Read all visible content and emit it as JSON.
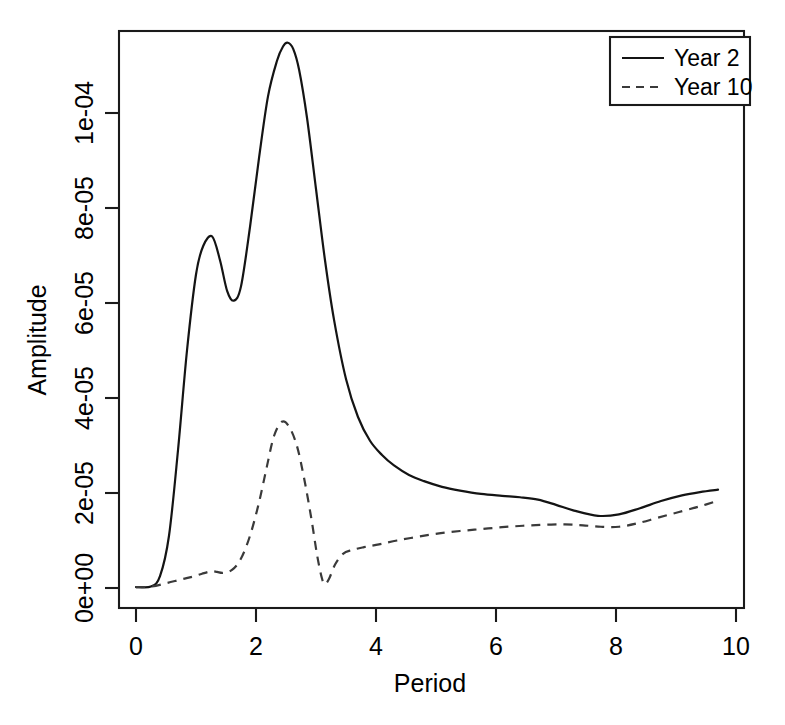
{
  "chart_data": {
    "type": "line",
    "title": "",
    "xlabel": "Period",
    "ylabel": "Amplitude",
    "xlim": [
      0,
      10
    ],
    "ylim": [
      0,
      0.000118
    ],
    "xticks": [
      0,
      2,
      4,
      6,
      8,
      10
    ],
    "xtick_labels": [
      "0",
      "2",
      "4",
      "6",
      "8",
      "10"
    ],
    "yticks": [
      0,
      2e-05,
      4e-05,
      6e-05,
      8e-05,
      0.0001
    ],
    "ytick_labels": [
      "0e+00",
      "2e-05",
      "4e-05",
      "6e-05",
      "8e-05",
      "1e-04"
    ],
    "grid": false,
    "legend_position": "top-right",
    "series": [
      {
        "name": "Year 2",
        "style": "solid",
        "color": "#141414",
        "x": [
          0.0,
          0.25,
          0.4,
          0.55,
          0.7,
          0.85,
          1.0,
          1.12,
          1.27,
          1.4,
          1.52,
          1.63,
          1.75,
          1.9,
          2.05,
          2.2,
          2.35,
          2.45,
          2.53,
          2.62,
          2.72,
          2.85,
          3.0,
          3.15,
          3.3,
          3.5,
          3.7,
          3.9,
          4.1,
          4.3,
          4.55,
          4.8,
          5.1,
          5.4,
          5.75,
          6.1,
          6.4,
          6.7,
          7.0,
          7.3,
          7.7,
          8.05,
          8.4,
          8.75,
          9.1,
          9.4,
          9.7
        ],
        "y": [
          2e-07,
          3e-07,
          2.5e-06,
          1.1e-05,
          2.9e-05,
          5e-05,
          6.6e-05,
          7.2e-05,
          7.4e-05,
          6.9e-05,
          6.25e-05,
          6.05e-05,
          6.35e-05,
          7.6e-05,
          9.05e-05,
          0.0001035,
          0.000111,
          0.000114,
          0.0001148,
          0.0001135,
          0.000109,
          9.9e-05,
          8.4e-05,
          6.9e-05,
          5.65e-05,
          4.4e-05,
          3.6e-05,
          3.1e-05,
          2.8e-05,
          2.58e-05,
          2.38e-05,
          2.25e-05,
          2.13e-05,
          2.05e-05,
          1.98e-05,
          1.94e-05,
          1.91e-05,
          1.86e-05,
          1.75e-05,
          1.63e-05,
          1.52e-05,
          1.55e-05,
          1.68e-05,
          1.83e-05,
          1.95e-05,
          2.02e-05,
          2.07e-05
        ]
      },
      {
        "name": "Year 10",
        "style": "dashed",
        "color": "#3a3a3a",
        "x": [
          0.0,
          0.25,
          0.5,
          0.75,
          0.95,
          1.1,
          1.25,
          1.35,
          1.45,
          1.6,
          1.75,
          1.9,
          2.05,
          2.18,
          2.3,
          2.43,
          2.55,
          2.68,
          2.8,
          2.92,
          3.02,
          3.1,
          3.15,
          3.22,
          3.32,
          3.45,
          3.6,
          3.8,
          4.05,
          4.35,
          4.7,
          5.05,
          5.4,
          5.75,
          6.1,
          6.45,
          6.8,
          7.15,
          7.45,
          7.75,
          8.05,
          8.35,
          8.7,
          9.05,
          9.4,
          9.7
        ],
        "y": [
          2e-07,
          3e-07,
          1e-06,
          1.8e-06,
          2.4e-06,
          3e-06,
          3.5e-06,
          3.4e-06,
          3.2e-06,
          3.8e-06,
          6.2e-06,
          1.1e-05,
          1.8e-05,
          2.55e-05,
          3.2e-05,
          3.5e-05,
          3.4e-05,
          3e-05,
          2.32e-05,
          1.48e-05,
          6.8e-06,
          2e-06,
          8e-07,
          2e-06,
          5e-06,
          7.2e-06,
          8e-06,
          8.6e-06,
          9.2e-06,
          1e-05,
          1.08e-05,
          1.15e-05,
          1.2e-05,
          1.24e-05,
          1.28e-05,
          1.31e-05,
          1.33e-05,
          1.34e-05,
          1.32e-05,
          1.29e-05,
          1.29e-05,
          1.36e-05,
          1.48e-05,
          1.6e-05,
          1.72e-05,
          1.84e-05
        ]
      }
    ],
    "annotations": {
      "year2_primary_peak": {
        "period": 2.53,
        "amplitude": 0.0001148
      },
      "year2_secondary_peak": {
        "period": 1.27,
        "amplitude": 7.4e-05
      },
      "year2_local_trough": {
        "period": 1.63,
        "amplitude": 6.05e-05
      },
      "year2_minimum": {
        "period": 7.7,
        "amplitude": 1.52e-05
      },
      "year10_peak": {
        "period": 2.43,
        "amplitude": 3.5e-05
      },
      "year10_dip": {
        "period": 3.15,
        "amplitude": 8e-07
      }
    }
  },
  "legend": {
    "entries": [
      {
        "label": "Year 2",
        "style": "solid"
      },
      {
        "label": "Year 10",
        "style": "dashed"
      }
    ]
  },
  "axes": {
    "x_title": "Period",
    "y_title": "Amplitude"
  }
}
